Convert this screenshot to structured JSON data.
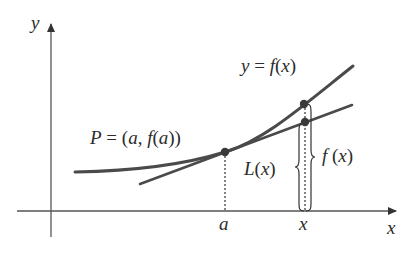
{
  "diagram": {
    "axes": {
      "x_label": "x",
      "y_label": "y"
    },
    "labels": {
      "curve": "y = f(x)",
      "point": "P = (a, f(a))",
      "tangent_value": "L(x)",
      "function_value": "f(x)",
      "tick_a": "a",
      "tick_x": "x"
    },
    "colors": {
      "line": "#4a4a4a",
      "text": "#2b2b2b",
      "axis": "#555555",
      "background": "#ffffff"
    }
  }
}
